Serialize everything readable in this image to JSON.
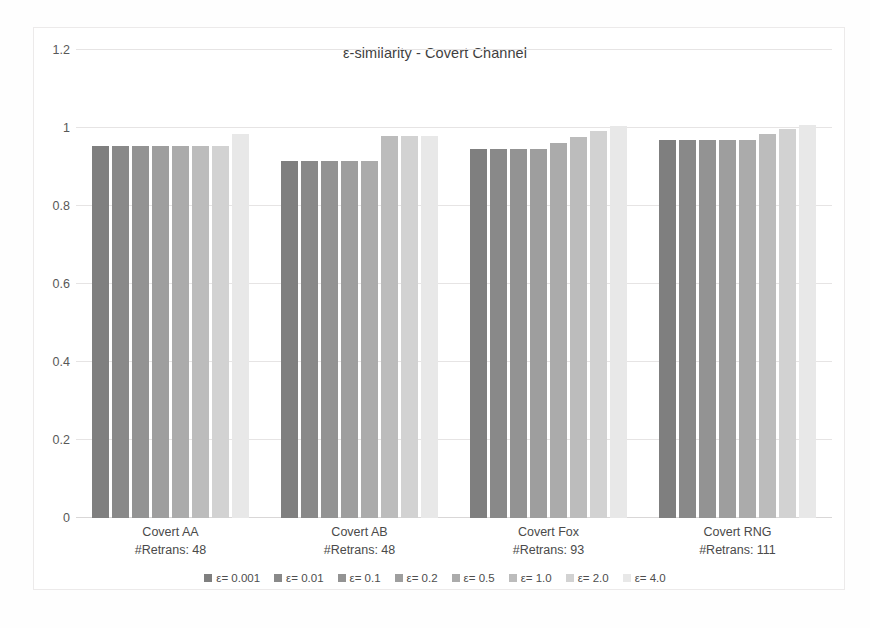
{
  "chart_data": {
    "type": "bar",
    "title": "ε-similarity - Covert Channel",
    "xlabel": "",
    "ylabel": "",
    "ylim": [
      0,
      1.2
    ],
    "yticks": [
      0,
      0.2,
      0.4,
      0.6,
      0.8,
      1,
      1.2
    ],
    "ytick_labels": [
      "0",
      "0.2",
      "0.4",
      "0.6",
      "0.8",
      "1",
      "1.2"
    ],
    "grid": true,
    "legend_position": "bottom",
    "categories": [
      "Covert AA",
      "Covert AB",
      "Covert Fox",
      "Covert RNG"
    ],
    "category_sublabels": [
      "#Retrans: 48",
      "#Retrans: 48",
      "#Retrans: 93",
      "#Retrans: 111"
    ],
    "series": [
      {
        "name": "ε= 0.001",
        "color": "#7f7f7f",
        "values": [
          0.955,
          0.915,
          0.947,
          0.968
        ]
      },
      {
        "name": "ε= 0.01",
        "color": "#898989",
        "values": [
          0.955,
          0.915,
          0.947,
          0.968
        ]
      },
      {
        "name": "ε= 0.1",
        "color": "#939393",
        "values": [
          0.955,
          0.915,
          0.947,
          0.968
        ]
      },
      {
        "name": "ε= 0.2",
        "color": "#9e9e9e",
        "values": [
          0.955,
          0.915,
          0.947,
          0.968
        ]
      },
      {
        "name": "ε= 0.5",
        "color": "#ababab",
        "values": [
          0.955,
          0.915,
          0.962,
          0.968
        ]
      },
      {
        "name": "ε= 1.0",
        "color": "#bcbcbc",
        "values": [
          0.955,
          0.98,
          0.978,
          0.985
        ]
      },
      {
        "name": "ε= 2.0",
        "color": "#d2d2d2",
        "values": [
          0.955,
          0.98,
          0.993,
          0.998
        ]
      },
      {
        "name": "ε= 4.0",
        "color": "#e8e8e8",
        "values": [
          0.985,
          0.98,
          1.005,
          1.008
        ]
      }
    ]
  },
  "legend": {
    "items": [
      {
        "label": "ε= 0.001"
      },
      {
        "label": "ε= 0.01"
      },
      {
        "label": "ε= 0.1"
      },
      {
        "label": "ε= 0.2"
      },
      {
        "label": "ε= 0.5"
      },
      {
        "label": "ε= 1.0"
      },
      {
        "label": "ε= 2.0"
      },
      {
        "label": "ε= 4.0"
      }
    ]
  }
}
